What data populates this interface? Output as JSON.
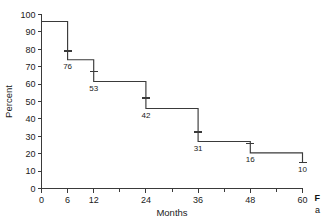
{
  "figure": {
    "kind": "kaplan-meier-survival-plot",
    "background_color": "#ffffff",
    "ink_color": "#3a3a3a"
  },
  "caption_fragment": {
    "line1": "F",
    "line2": "a"
  },
  "chart_data": {
    "type": "line",
    "title": "",
    "xlabel": "Months",
    "ylabel": "Percent",
    "xlim": [
      0,
      60
    ],
    "ylim": [
      0,
      100
    ],
    "grid": false,
    "legend": "none",
    "x_ticks_major": [
      0,
      6,
      12,
      24,
      36,
      48,
      60
    ],
    "x_ticks_minor": [
      18,
      30,
      42,
      54
    ],
    "x_ticklabels": [
      "0",
      "6",
      "12",
      "24",
      "36",
      "48",
      "60"
    ],
    "y_ticks": [
      0,
      10,
      20,
      30,
      40,
      50,
      60,
      70,
      80,
      90,
      100
    ],
    "y_ticklabels": [
      "0",
      "10",
      "20",
      "30",
      "40",
      "50",
      "60",
      "70",
      "80",
      "90",
      "100"
    ],
    "step_points": [
      {
        "x": 0,
        "y": 96.0
      },
      {
        "x": 6,
        "y": 96.0
      },
      {
        "x": 6,
        "y": 74.0
      },
      {
        "x": 12,
        "y": 74.0
      },
      {
        "x": 12,
        "y": 61.5
      },
      {
        "x": 24,
        "y": 61.5
      },
      {
        "x": 24,
        "y": 46.0
      },
      {
        "x": 36,
        "y": 46.0
      },
      {
        "x": 36,
        "y": 27.0
      },
      {
        "x": 48,
        "y": 27.0
      },
      {
        "x": 48,
        "y": 20.5
      },
      {
        "x": 60,
        "y": 20.5
      },
      {
        "x": 60,
        "y": 15.0
      }
    ],
    "censor_marks": [
      {
        "x": 6,
        "y": 79.0
      },
      {
        "x": 12,
        "y": 67.0
      },
      {
        "x": 24,
        "y": 52.0
      },
      {
        "x": 36,
        "y": 32.5
      },
      {
        "x": 48,
        "y": 26.0
      },
      {
        "x": 60,
        "y": 15.0
      }
    ],
    "at_risk": [
      {
        "x": 6,
        "label": "76"
      },
      {
        "x": 12,
        "label": "53"
      },
      {
        "x": 24,
        "label": "42"
      },
      {
        "x": 36,
        "label": "31"
      },
      {
        "x": 48,
        "label": "16"
      },
      {
        "x": 60,
        "label": "10"
      }
    ],
    "at_risk_labels": [
      "76",
      "53",
      "42",
      "31",
      "16",
      "10"
    ]
  }
}
